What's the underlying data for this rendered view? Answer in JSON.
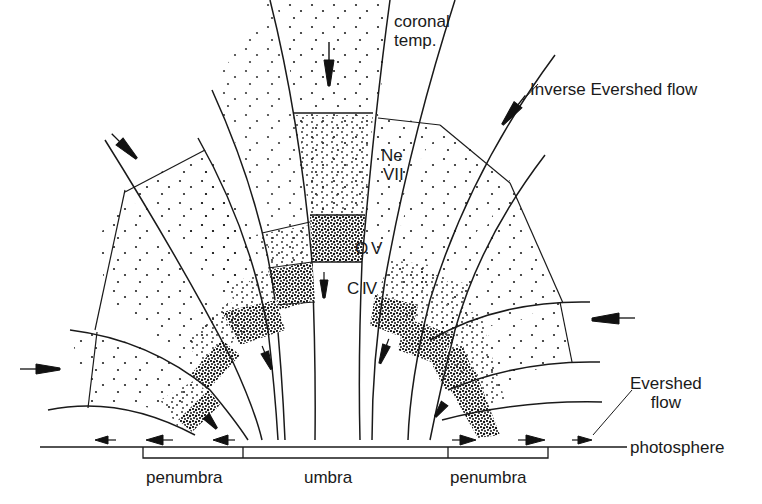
{
  "diagram": {
    "type": "sunspot-loop-flow-schematic",
    "labels": {
      "coronal_temp": [
        "coronal",
        "temp."
      ],
      "ne_vii": [
        "Ne",
        "VII"
      ],
      "o_v": "O V",
      "c_iv": "C IV",
      "inverse_evershed_flow": "Inverse Evershed flow",
      "evershed_flow": [
        "Evershed",
        "flow"
      ],
      "photosphere": "photosphere",
      "penumbra_left": "penumbra",
      "umbra": "umbra",
      "penumbra_right": "penumbra"
    },
    "layers_from_top": [
      "coronal temp.",
      "Ne VII",
      "O V",
      "C IV"
    ],
    "colors": {
      "ink": "#1a1a1a",
      "background": "#ffffff"
    }
  }
}
